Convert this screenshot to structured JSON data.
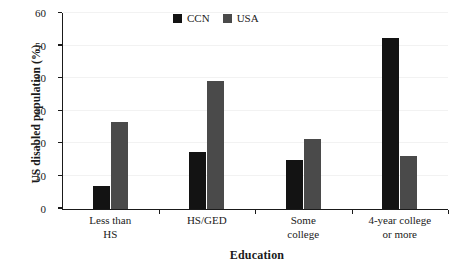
{
  "chart_data": {
    "type": "bar",
    "title": "",
    "xlabel": "Education",
    "ylabel": "US disabled population (%)",
    "categories": [
      "Less than HS",
      "HS/GED",
      "Some college",
      "4-year college or more"
    ],
    "category_lines": [
      [
        "Less than",
        "HS"
      ],
      [
        "HS/GED"
      ],
      [
        "Some",
        "college"
      ],
      [
        "4-year college",
        "or more"
      ]
    ],
    "series": [
      {
        "name": "CCN",
        "color": "#131313",
        "values": [
          7.0,
          17.5,
          14.8,
          52.2
        ]
      },
      {
        "name": "USA",
        "color": "#4a4a4a",
        "values": [
          26.5,
          39.3,
          21.3,
          16.2
        ]
      }
    ],
    "ylim": [
      0,
      60
    ],
    "yticks": [
      0,
      10,
      20,
      30,
      40,
      50,
      60
    ],
    "ytick_labels": [
      "0",
      "10",
      "20",
      "30",
      "40",
      "50",
      "60"
    ],
    "grid": "horizontal",
    "legend_position": "top-center",
    "xtick_style": "group-boundaries"
  },
  "legend": {
    "entries": [
      {
        "label": "CCN",
        "color": "#131313"
      },
      {
        "label": "USA",
        "color": "#4a4a4a"
      }
    ]
  }
}
